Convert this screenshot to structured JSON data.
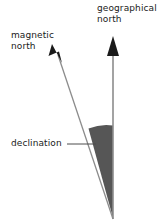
{
  "diagram": {
    "labels": {
      "geographical_north_line1": "geographical",
      "geographical_north_line2": "north",
      "magnetic_north_line1": "magnetic",
      "magnetic_north_line2": "north",
      "declination": "declination"
    },
    "colors": {
      "line": "#8c8c8c",
      "arrowhead": "#1a1a1a",
      "wedge_fill": "#565656",
      "text": "#1a1a1a",
      "background": "#ffffff",
      "leader_line": "#4d4d4d"
    },
    "elements": [
      {
        "name": "geographical-north-arrow",
        "type": "arrow",
        "orientation": "vertical",
        "from": [
          113,
          218
        ],
        "to": [
          113,
          45
        ]
      },
      {
        "name": "magnetic-north-arrow",
        "type": "arrow",
        "orientation": "tilted",
        "from": [
          113,
          218
        ],
        "to": [
          53,
          46
        ]
      },
      {
        "name": "declination-angle-wedge",
        "type": "filled-sector",
        "apex": [
          113,
          218
        ],
        "arc_left": [
          88,
          128
        ],
        "arc_right": [
          113,
          125
        ]
      },
      {
        "name": "declination-leader-line",
        "type": "leader",
        "from": [
          68,
          144
        ],
        "to": [
          95,
          144
        ]
      }
    ]
  }
}
